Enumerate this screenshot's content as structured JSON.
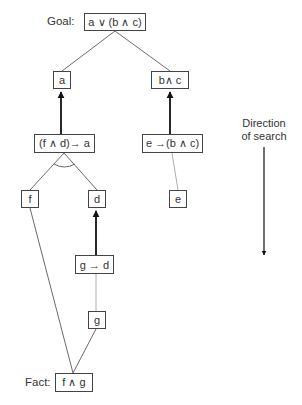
{
  "goal_label": "Goal:",
  "fact_label": "Fact:",
  "direction": {
    "line1": "Direction",
    "line2": "of search"
  },
  "nodes": {
    "goal": "a ∨ (b ∧ c)",
    "a": "a",
    "bc": "b∧ c",
    "rule_fda": "(f ∧ d)→ a",
    "rule_ebc": "e →(b ∧ c)",
    "f": "f",
    "d": "d",
    "e": "e",
    "rule_gd": "g → d",
    "g": "g",
    "fact": "f ∧ g"
  }
}
